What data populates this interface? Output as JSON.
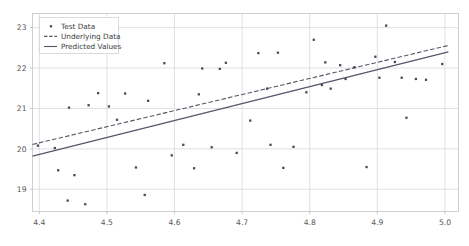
{
  "chart_data": {
    "type": "scatter",
    "title": "",
    "xlabel": "",
    "ylabel": "",
    "xlim": [
      4.39,
      5.02
    ],
    "ylim": [
      18.45,
      23.35
    ],
    "grid": true,
    "xticks": [
      "4.4",
      "4.5",
      "4.6",
      "4.7",
      "4.8",
      "4.9",
      "5.0"
    ],
    "xtick_values": [
      4.4,
      4.5,
      4.6,
      4.7,
      4.8,
      4.9,
      5.0
    ],
    "yticks": [
      "19",
      "20",
      "21",
      "22",
      "23"
    ],
    "ytick_values": [
      19,
      20,
      21,
      22,
      23
    ],
    "legend_position": "upper left",
    "legend": [
      {
        "label": "Test Data",
        "marker": "point",
        "style": "scatter",
        "color": "#4a4a5a"
      },
      {
        "label": "Underlying Data",
        "marker": "line",
        "style": "dashed",
        "color": "#555566"
      },
      {
        "label": "Predicted Values",
        "marker": "line",
        "style": "solid",
        "color": "#555566"
      }
    ],
    "series": [
      {
        "name": "Test Data",
        "type": "scatter",
        "color": "#4a4a5a",
        "points": [
          [
            4.398,
            20.08
          ],
          [
            4.423,
            20.02
          ],
          [
            4.428,
            19.47
          ],
          [
            4.442,
            18.72
          ],
          [
            4.444,
            21.02
          ],
          [
            4.452,
            19.35
          ],
          [
            4.468,
            18.63
          ],
          [
            4.473,
            21.08
          ],
          [
            4.487,
            21.38
          ],
          [
            4.503,
            21.05
          ],
          [
            4.515,
            20.72
          ],
          [
            4.527,
            21.37
          ],
          [
            4.543,
            19.54
          ],
          [
            4.556,
            18.86
          ],
          [
            4.561,
            21.19
          ],
          [
            4.585,
            22.12
          ],
          [
            4.596,
            19.84
          ],
          [
            4.613,
            20.1
          ],
          [
            4.629,
            19.52
          ],
          [
            4.636,
            21.35
          ],
          [
            4.641,
            21.99
          ],
          [
            4.655,
            20.04
          ],
          [
            4.667,
            21.98
          ],
          [
            4.676,
            22.13
          ],
          [
            4.692,
            19.9
          ],
          [
            4.712,
            20.7
          ],
          [
            4.724,
            22.37
          ],
          [
            4.737,
            21.49
          ],
          [
            4.742,
            20.1
          ],
          [
            4.753,
            22.38
          ],
          [
            4.761,
            19.53
          ],
          [
            4.776,
            20.05
          ],
          [
            4.795,
            21.4
          ],
          [
            4.806,
            22.7
          ],
          [
            4.818,
            21.58
          ],
          [
            4.823,
            22.14
          ],
          [
            4.831,
            21.49
          ],
          [
            4.845,
            22.07
          ],
          [
            4.853,
            21.73
          ],
          [
            4.866,
            22.02
          ],
          [
            4.884,
            19.55
          ],
          [
            4.897,
            22.28
          ],
          [
            4.903,
            21.76
          ],
          [
            4.913,
            23.05
          ],
          [
            4.926,
            22.15
          ],
          [
            4.936,
            21.76
          ],
          [
            4.943,
            20.77
          ],
          [
            4.957,
            21.73
          ],
          [
            4.972,
            21.71
          ],
          [
            4.996,
            22.1
          ]
        ]
      },
      {
        "name": "Underlying Data",
        "type": "line",
        "style": "dashed",
        "color": "#555566",
        "points": [
          [
            4.39,
            20.11
          ],
          [
            5.005,
            22.56
          ]
        ]
      },
      {
        "name": "Predicted Values",
        "type": "line",
        "style": "solid",
        "color": "#555566",
        "points": [
          [
            4.39,
            19.82
          ],
          [
            5.005,
            22.4
          ]
        ]
      }
    ]
  }
}
